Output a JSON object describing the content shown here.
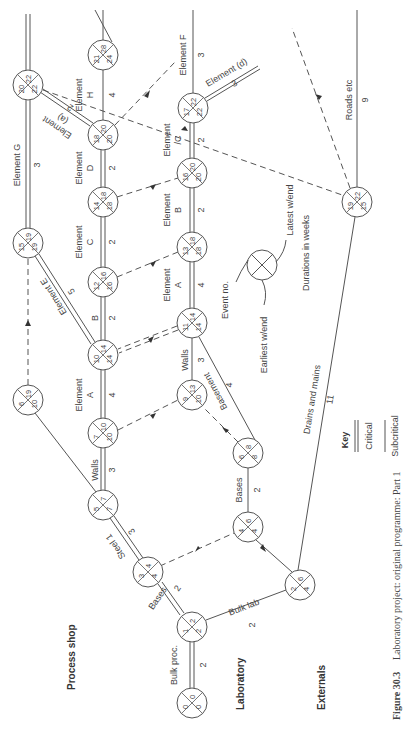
{
  "caption": {
    "figure": "Figure 30.3",
    "text": "Laboratory project: original programme: Part 1"
  },
  "sections": [
    "Process shop",
    "Laboratory",
    "Externals"
  ],
  "legend": {
    "key_title": "Key",
    "critical_label": "Critical",
    "subcritical_label": "Subcritical",
    "event_no": "Event no.",
    "earliest": "Earliest w/end",
    "latest": "Latest w/end",
    "durations": "Durations in weeks"
  },
  "nodes": [
    {
      "id": "n0",
      "event": "0",
      "earliest": "0",
      "latest": "0",
      "x": 192,
      "y": 703
    },
    {
      "id": "n1",
      "event": "1",
      "earliest": "2",
      "latest": "2",
      "x": 192,
      "y": 627
    },
    {
      "id": "n2",
      "event": "2",
      "earliest": "4",
      "latest": "6",
      "x": 300,
      "y": 585
    },
    {
      "id": "n3",
      "event": "3",
      "earliest": "4",
      "latest": "4",
      "x": 148,
      "y": 572
    },
    {
      "id": "n4",
      "event": "4",
      "earliest": "4",
      "latest": "6",
      "x": 248,
      "y": 527
    },
    {
      "id": "n5",
      "event": "5",
      "earliest": "7",
      "latest": "7",
      "x": 103,
      "y": 505
    },
    {
      "id": "n6",
      "event": "6",
      "earliest": "8",
      "latest": "8",
      "x": 248,
      "y": 453
    },
    {
      "id": "n7",
      "event": "7",
      "earliest": "10",
      "latest": "10",
      "x": 103,
      "y": 433
    },
    {
      "id": "n6b",
      "event": "6",
      "earliest": "10",
      "latest": "19",
      "x": 28,
      "y": 400
    },
    {
      "id": "n9",
      "event": "9",
      "earliest": "10",
      "latest": "13",
      "x": 192,
      "y": 395
    },
    {
      "id": "n10",
      "event": "10",
      "earliest": "14",
      "latest": "14",
      "x": 103,
      "y": 355
    },
    {
      "id": "n11",
      "event": "11",
      "earliest": "14",
      "latest": "14",
      "x": 192,
      "y": 323
    },
    {
      "id": "n12",
      "event": "12",
      "earliest": "16",
      "latest": "16",
      "x": 103,
      "y": 282
    },
    {
      "id": "n13",
      "event": "13",
      "earliest": "18",
      "latest": "18",
      "x": 192,
      "y": 247
    },
    {
      "id": "n15",
      "event": "15",
      "earliest": "19",
      "latest": "19",
      "x": 28,
      "y": 243
    },
    {
      "id": "n14",
      "event": "14",
      "earliest": "18",
      "latest": "18",
      "x": 103,
      "y": 202
    },
    {
      "id": "n19",
      "event": "19",
      "earliest": "15",
      "latest": "22",
      "x": 357,
      "y": 202
    },
    {
      "id": "n16",
      "event": "16",
      "earliest": "20",
      "latest": "20",
      "x": 192,
      "y": 173
    },
    {
      "id": "n18",
      "event": "18",
      "earliest": "20",
      "latest": "20",
      "x": 103,
      "y": 135
    },
    {
      "id": "n17",
      "event": "17",
      "earliest": "22",
      "latest": "22",
      "x": 193,
      "y": 108
    },
    {
      "id": "n20",
      "event": "20",
      "earliest": "22",
      "latest": "22",
      "x": 28,
      "y": 85
    },
    {
      "id": "n21",
      "event": "21",
      "earliest": "24",
      "latest": "28",
      "x": 103,
      "y": 55
    }
  ],
  "activities": [
    {
      "from": "n0",
      "to": "n1",
      "name": "Bulk proc.",
      "duration": "2",
      "type": "critical"
    },
    {
      "from": "n1",
      "to": "n3",
      "name": "Bases",
      "duration": "2",
      "type": "critical"
    },
    {
      "from": "n1",
      "to": "n2",
      "name": "Bulk lab",
      "duration": "2",
      "type": "subcritical"
    },
    {
      "from": "n3",
      "to": "n5",
      "name": "Steel 1",
      "duration": "3",
      "type": "critical"
    },
    {
      "from": "n3",
      "to": "n4",
      "name": "",
      "duration": "",
      "type": "dummy"
    },
    {
      "from": "n2",
      "to": "n4",
      "name": "",
      "duration": "",
      "type": "subcritical"
    },
    {
      "from": "n4",
      "to": "n6",
      "name": "Bases",
      "duration": "2",
      "type": "subcritical"
    },
    {
      "from": "n5",
      "to": "n7",
      "name": "Walls",
      "duration": "3",
      "type": "critical"
    },
    {
      "from": "n5",
      "to": "n6b",
      "name": "Steel 2",
      "duration": "3",
      "type": "subcritical"
    },
    {
      "from": "n6",
      "to": "n9",
      "name": "",
      "duration": "",
      "type": "dummy"
    },
    {
      "from": "n6",
      "to": "n11",
      "name": "Basement",
      "duration": "4",
      "type": "subcritical"
    },
    {
      "from": "n7",
      "to": "n10",
      "name": "Element A",
      "duration": "4",
      "type": "critical"
    },
    {
      "from": "n7",
      "to": "n9",
      "name": "",
      "duration": "",
      "type": "dummy"
    },
    {
      "from": "n9",
      "to": "n11",
      "name": "Walls",
      "duration": "3",
      "type": "subcritical"
    },
    {
      "from": "n6b",
      "to": "n15",
      "name": "",
      "duration": "",
      "type": "dummy"
    },
    {
      "from": "n11",
      "to": "n10",
      "name": "",
      "duration": "",
      "type": "critical-dummy"
    },
    {
      "from": "n10",
      "to": "n12",
      "name": "B",
      "duration": "2",
      "type": "critical"
    },
    {
      "from": "n10",
      "to": "n15",
      "name": "Element E",
      "duration": "5",
      "type": "critical"
    },
    {
      "from": "n11",
      "to": "n13",
      "name": "Element A",
      "duration": "4",
      "type": "critical"
    },
    {
      "from": "n12",
      "to": "n14",
      "name": "Element C",
      "duration": "2",
      "type": "critical"
    },
    {
      "from": "n12",
      "to": "n13",
      "name": "",
      "duration": "",
      "type": "dummy"
    },
    {
      "from": "n15",
      "to": "n20",
      "name": "Element G",
      "duration": "3",
      "type": "critical"
    },
    {
      "from": "n13",
      "to": "n16",
      "name": "Element B",
      "duration": "2",
      "type": "critical"
    },
    {
      "from": "n14",
      "to": "n16",
      "name": "",
      "duration": "",
      "type": "dummy"
    },
    {
      "from": "n14",
      "to": "n18",
      "name": "Element D",
      "duration": "2",
      "type": "critical"
    },
    {
      "from": "n16",
      "to": "n17",
      "name": "Element C",
      "duration": "2",
      "type": "critical"
    },
    {
      "from": "n18",
      "to": "n20",
      "name": "Element (a)",
      "duration": "2",
      "type": "critical"
    },
    {
      "from": "n18",
      "to": "n21",
      "name": "Element H",
      "duration": "4",
      "type": "subcritical"
    },
    {
      "from": "n17",
      "to": "out_f",
      "name": "Element F",
      "duration": "3",
      "type": "subcritical"
    },
    {
      "from": "n17",
      "to": "out_d",
      "name": "Element (d)",
      "duration": "3",
      "type": "critical"
    },
    {
      "from": "n2",
      "to": "n19",
      "name": "Drains and mains",
      "duration": "11",
      "type": "subcritical"
    },
    {
      "from": "n19",
      "to": "out_r",
      "name": "Roads etc",
      "duration": "9",
      "type": "subcritical"
    }
  ]
}
